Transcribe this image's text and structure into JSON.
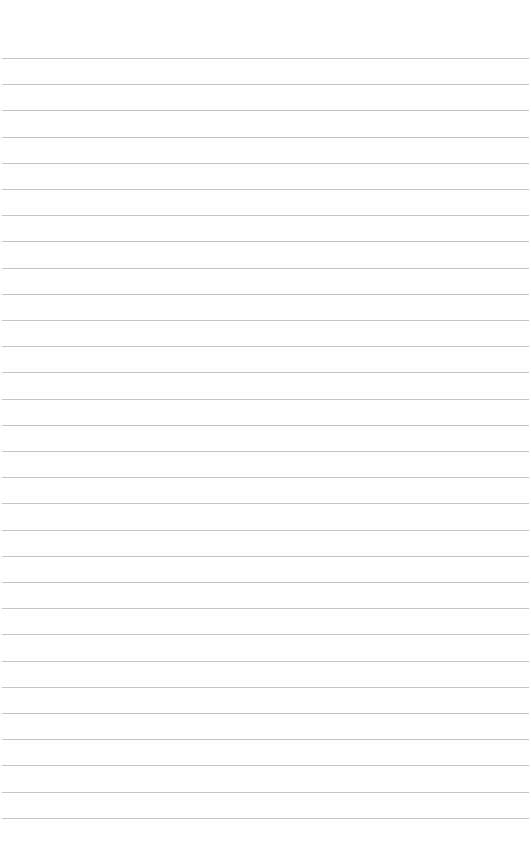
{
  "page": {
    "type": "lined-paper",
    "background_color": "#ffffff",
    "rule_color": "#c4c4c4",
    "rule_count": 30,
    "first_rule_y": 58,
    "rule_spacing": 26.2,
    "text_content": ""
  }
}
